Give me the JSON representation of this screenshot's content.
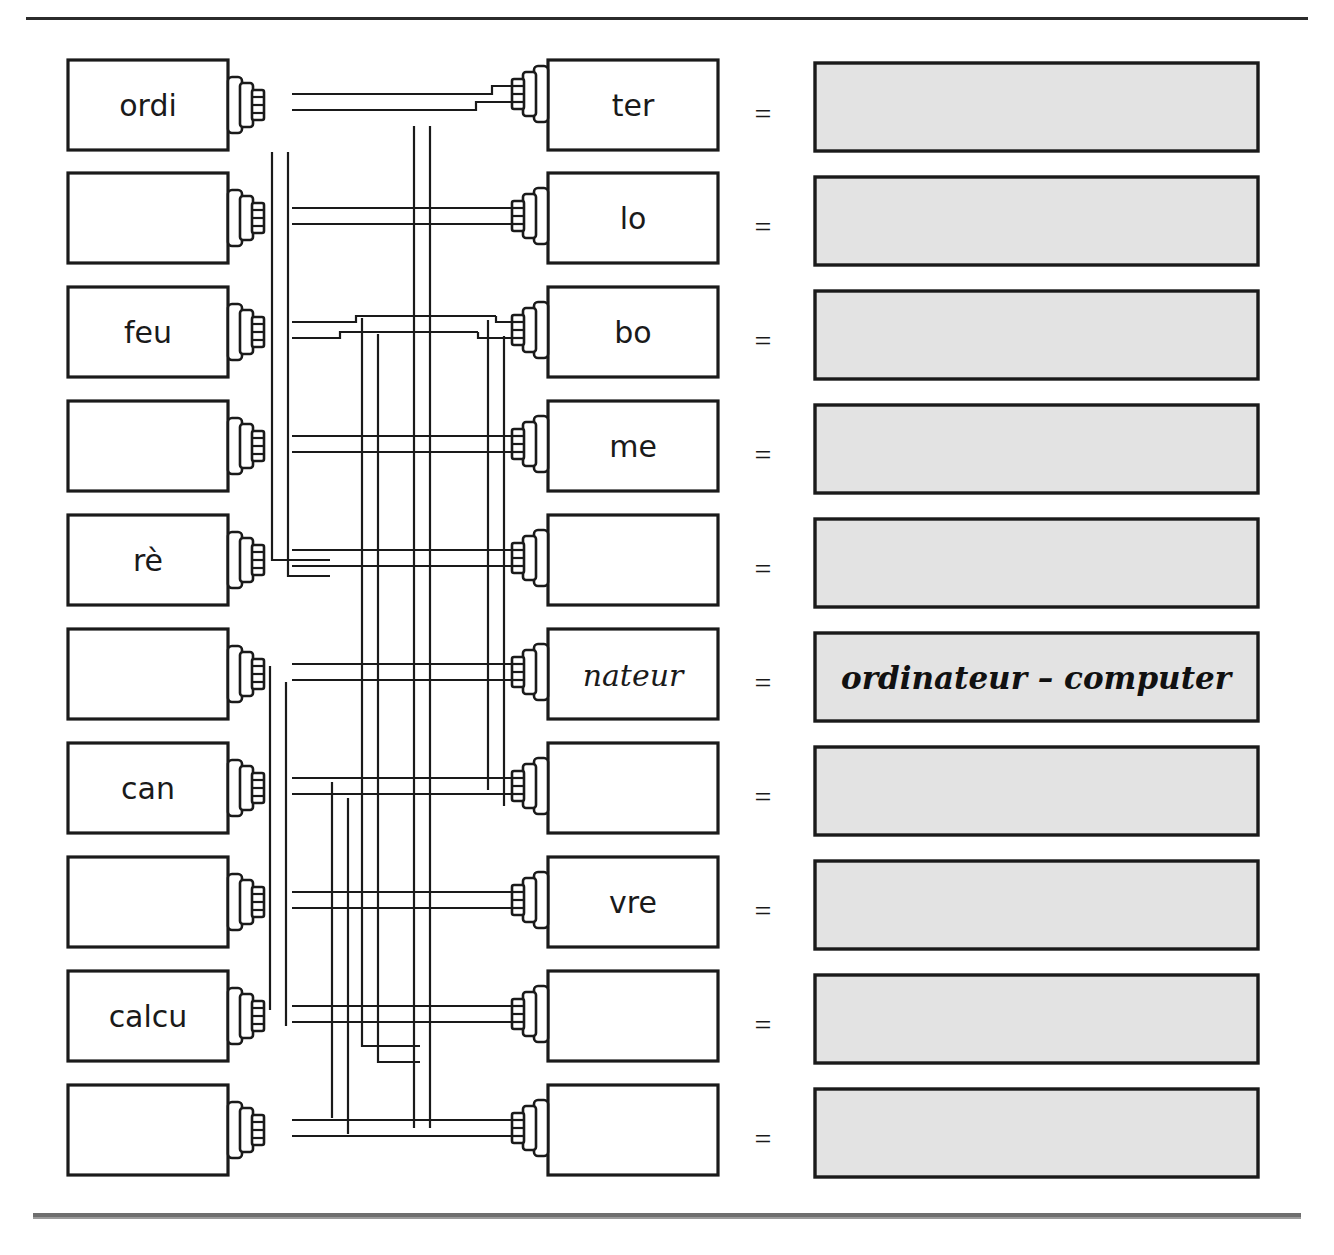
{
  "worksheet": {
    "title_fragment": "",
    "equals_sign": "=",
    "separator_top": true,
    "separator_bottom": true
  },
  "colors": {
    "ink": "#1a1a1a",
    "answer_fill": "#e3e3e3",
    "box_fill": "#ffffff",
    "rule_top": "#2b2b2b",
    "rule_bottom": "#6e6e6e"
  },
  "rows": [
    {
      "index": 0,
      "left_label": "ordi",
      "right_label": "ter",
      "right_italic": false,
      "answer": ""
    },
    {
      "index": 1,
      "left_label": "",
      "right_label": "lo",
      "right_italic": false,
      "answer": ""
    },
    {
      "index": 2,
      "left_label": "feu",
      "right_label": "bo",
      "right_italic": false,
      "answer": ""
    },
    {
      "index": 3,
      "left_label": "",
      "right_label": "me",
      "right_italic": false,
      "answer": ""
    },
    {
      "index": 4,
      "left_label": "rè",
      "right_label": "",
      "right_italic": false,
      "answer": ""
    },
    {
      "index": 5,
      "left_label": "",
      "right_label": "nateur",
      "right_italic": true,
      "answer": "ordinateur – computer"
    },
    {
      "index": 6,
      "left_label": "can",
      "right_label": "",
      "right_italic": false,
      "answer": ""
    },
    {
      "index": 7,
      "left_label": "",
      "right_label": "vre",
      "right_italic": false,
      "answer": ""
    },
    {
      "index": 8,
      "left_label": "calcu",
      "right_label": "",
      "right_italic": false,
      "answer": ""
    },
    {
      "index": 9,
      "left_label": "",
      "right_label": "",
      "right_italic": false,
      "answer": ""
    }
  ],
  "wires": [
    {
      "from_row": 0,
      "to_row": 0,
      "note": "ordi to ter"
    },
    {
      "from_row": 1,
      "to_row": 1,
      "note": "row2 to lo"
    },
    {
      "from_row": 2,
      "to_row": 2,
      "note": "feu to bo"
    },
    {
      "from_row": 3,
      "to_row": 3,
      "note": "row4 to me"
    },
    {
      "from_row": 4,
      "to_row": 4,
      "note": "re to row5"
    },
    {
      "from_row": 5,
      "to_row": 5,
      "note": "row6 to nateur"
    },
    {
      "from_row": 6,
      "to_row": 6,
      "note": "can to row7"
    },
    {
      "from_row": 7,
      "to_row": 7,
      "note": "row8 to vre"
    },
    {
      "from_row": 8,
      "to_row": 8,
      "note": "calcu to row9"
    },
    {
      "from_row": 9,
      "to_row": 9,
      "note": "row10 to row10"
    }
  ]
}
